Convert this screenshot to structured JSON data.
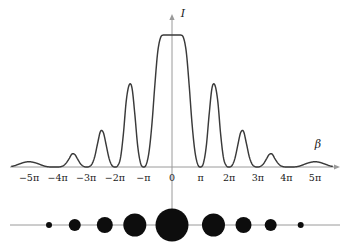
{
  "figure": {
    "title": "",
    "axis_labels": {
      "x": "β",
      "y": "I"
    },
    "colors": {
      "curve": "#3a3a3a",
      "axis": "#9a9a9a",
      "dots": "#0d0d0d",
      "text": "#1a1a1a",
      "background": "#ffffff"
    },
    "x_ticks": [
      {
        "label": "−5π",
        "value": -5
      },
      {
        "label": "−4π",
        "value": -4
      },
      {
        "label": "−3π",
        "value": -3
      },
      {
        "label": "−2π",
        "value": -2
      },
      {
        "label": "−π",
        "value": -1
      },
      {
        "label": "0",
        "value": 0
      },
      {
        "label": "π",
        "value": 1
      },
      {
        "label": "2π",
        "value": 2
      },
      {
        "label": "3π",
        "value": 3
      },
      {
        "label": "4π",
        "value": 4
      },
      {
        "label": "5π",
        "value": 5
      }
    ]
  },
  "chart_data": {
    "type": "line",
    "title": "",
    "xlabel": "β",
    "ylabel": "I",
    "xlim": [
      -5.6,
      5.6
    ],
    "ylim": [
      0,
      1
    ],
    "grid": false,
    "legend": null,
    "x_unit": "pi",
    "curve_model": {
      "form": "envelope * grating",
      "envelope": "sinc^2(beta/ (2*pi) * 0.45)",
      "grating": "(sin(3*u)/(3*sin(u)))^2"
    },
    "peaks": [
      {
        "x": 0.0,
        "height": 1.0,
        "kind": "principal"
      },
      {
        "x": -1.5,
        "height": 0.62,
        "kind": "principal"
      },
      {
        "x": 1.5,
        "height": 0.62,
        "kind": "principal"
      },
      {
        "x": -2.5,
        "height": 0.27,
        "kind": "principal"
      },
      {
        "x": 2.5,
        "height": 0.27,
        "kind": "principal"
      },
      {
        "x": -3.5,
        "height": 0.1,
        "kind": "principal"
      },
      {
        "x": 3.5,
        "height": 0.1,
        "kind": "principal"
      },
      {
        "x": -4.5,
        "height": 0.04,
        "kind": "principal"
      },
      {
        "x": 4.5,
        "height": 0.04,
        "kind": "principal"
      }
    ],
    "minima": [
      -1.0,
      -2.0,
      -3.0,
      -4.0,
      -5.0,
      1.0,
      2.0,
      3.0,
      4.0,
      5.0
    ],
    "series": [
      {
        "name": "I(β)",
        "x": [
          -5.6,
          -5.5,
          -5.4,
          -5.3,
          -5.2,
          -5.1,
          -5.0,
          -4.9,
          -4.8,
          -4.7,
          -4.6,
          -4.5,
          -4.4,
          -4.3,
          -4.2,
          -4.1,
          -4.0,
          -3.9,
          -3.8,
          -3.7,
          -3.6,
          -3.5,
          -3.4,
          -3.3,
          -3.2,
          -3.1,
          -3.0,
          -2.9,
          -2.8,
          -2.7,
          -2.6,
          -2.5,
          -2.4,
          -2.3,
          -2.2,
          -2.1,
          -2.0,
          -1.9,
          -1.8,
          -1.7,
          -1.6,
          -1.5,
          -1.4,
          -1.3,
          -1.2,
          -1.1,
          -1.0,
          -0.9,
          -0.8,
          -0.7,
          -0.6,
          -0.5,
          -0.4,
          -0.3,
          -0.2,
          -0.1,
          0.0,
          0.1,
          0.2,
          0.3,
          0.4,
          0.5,
          0.6,
          0.7,
          0.8,
          0.9,
          1.0,
          1.1,
          1.2,
          1.3,
          1.4,
          1.5,
          1.6,
          1.7,
          1.8,
          1.9,
          2.0,
          2.1,
          2.2,
          2.3,
          2.4,
          2.5,
          2.6,
          2.7,
          2.8,
          2.9,
          3.0,
          3.1,
          3.2,
          3.3,
          3.4,
          3.5,
          3.6,
          3.7,
          3.8,
          3.9,
          4.0,
          4.1,
          4.2,
          4.3,
          4.4,
          4.5,
          4.6,
          4.7,
          4.8,
          4.9,
          5.0,
          5.1,
          5.2,
          5.3,
          5.4,
          5.5,
          5.6
        ],
        "y": [
          0.005,
          0.01,
          0.018,
          0.026,
          0.033,
          0.038,
          0.04,
          0.038,
          0.033,
          0.026,
          0.018,
          0.01,
          0.004,
          0.001,
          0.0,
          0.0,
          0.0,
          0.002,
          0.01,
          0.03,
          0.062,
          0.098,
          0.095,
          0.06,
          0.025,
          0.006,
          0.0,
          0.003,
          0.022,
          0.08,
          0.18,
          0.27,
          0.26,
          0.165,
          0.065,
          0.012,
          0.0,
          0.01,
          0.07,
          0.25,
          0.5,
          0.62,
          0.6,
          0.4,
          0.16,
          0.03,
          0.0,
          0.02,
          0.12,
          0.33,
          0.62,
          0.87,
          0.98,
          1.0,
          1.0,
          1.0,
          1.0,
          1.0,
          1.0,
          1.0,
          0.98,
          0.87,
          0.62,
          0.33,
          0.12,
          0.02,
          0.0,
          0.03,
          0.16,
          0.4,
          0.6,
          0.62,
          0.5,
          0.25,
          0.07,
          0.01,
          0.0,
          0.012,
          0.065,
          0.165,
          0.26,
          0.27,
          0.18,
          0.08,
          0.022,
          0.003,
          0.0,
          0.006,
          0.025,
          0.06,
          0.095,
          0.098,
          0.062,
          0.03,
          0.01,
          0.002,
          0.0,
          0.0,
          0.0,
          0.001,
          0.004,
          0.01,
          0.018,
          0.026,
          0.033,
          0.038,
          0.04,
          0.038,
          0.033,
          0.026,
          0.018,
          0.01,
          0.005
        ]
      }
    ],
    "spot_pattern": {
      "description": "Row of diffraction spots below the plot; spot diameter is proportional to the corresponding intensity maximum.",
      "axis_y_px": 225,
      "spots": [
        {
          "x": -4.3,
          "radius": 3.0,
          "label": "order-4-left"
        },
        {
          "x": -3.4,
          "radius": 6.0,
          "label": "order-3-left"
        },
        {
          "x": -2.35,
          "radius": 8.0,
          "label": "order-2b-left"
        },
        {
          "x": -1.3,
          "radius": 11.5,
          "label": "order-1-left"
        },
        {
          "x": 0.0,
          "radius": 16.5,
          "label": "order-0-center"
        },
        {
          "x": 1.45,
          "radius": 11.5,
          "label": "order-1-right"
        },
        {
          "x": 2.5,
          "radius": 8.0,
          "label": "order-2b-right"
        },
        {
          "x": 3.45,
          "radius": 6.0,
          "label": "order-3-right"
        },
        {
          "x": 4.5,
          "radius": 3.0,
          "label": "order-4-right"
        }
      ]
    }
  }
}
